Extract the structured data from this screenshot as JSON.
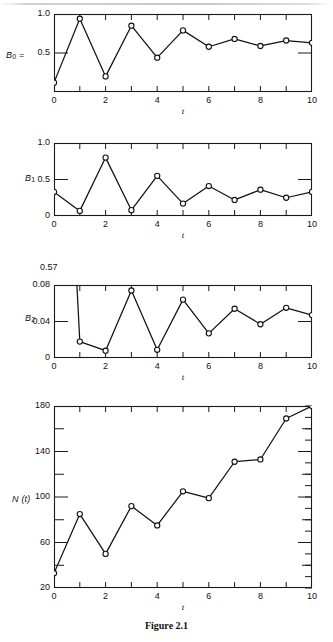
{
  "figure": {
    "caption": "Figure 2.1",
    "xlabel": "t",
    "x_tick_labels": [
      "0",
      "2",
      "4",
      "6",
      "8",
      "10"
    ],
    "x_tick_values": [
      0,
      2,
      4,
      6,
      8,
      10
    ],
    "x_minor_values": [
      1,
      3,
      5,
      7,
      9
    ],
    "xlim": [
      0,
      10
    ]
  },
  "chart_data": [
    {
      "type": "line",
      "id": "panel-b0",
      "title": "",
      "ylabel": "B₀ =",
      "ylabel_base": "B",
      "ylabel_sub": "0",
      "ylabel_suffix": " =",
      "xlabel": "t",
      "x": [
        0,
        1,
        2,
        3,
        4,
        5,
        6,
        7,
        8,
        9,
        10
      ],
      "values": [
        0.12,
        0.94,
        0.2,
        0.85,
        0.44,
        0.79,
        0.58,
        0.68,
        0.59,
        0.66,
        0.63
      ],
      "ylim": [
        0,
        1.0
      ],
      "y_tick_values": [
        0.5,
        1.0
      ],
      "y_tick_labels": [
        "0.5",
        "1.0"
      ],
      "grid": false,
      "legend": "none",
      "markers": "open-circle"
    },
    {
      "type": "line",
      "id": "panel-b1",
      "title": "",
      "ylabel": "B₁",
      "ylabel_base": "B",
      "ylabel_sub": "1",
      "ylabel_suffix": "",
      "xlabel": "t",
      "x": [
        0,
        1,
        2,
        3,
        4,
        5,
        6,
        7,
        8,
        9,
        10
      ],
      "values": [
        0.33,
        0.07,
        0.8,
        0.08,
        0.55,
        0.17,
        0.41,
        0.22,
        0.36,
        0.25,
        0.33
      ],
      "ylim": [
        0,
        1.0
      ],
      "y_tick_values": [
        0,
        0.5,
        1.0
      ],
      "y_tick_labels": [
        "0",
        "0.5",
        "1.0"
      ],
      "grid": false,
      "legend": "none",
      "markers": "open-circle"
    },
    {
      "type": "line",
      "id": "panel-b2",
      "title": "",
      "ylabel": "B₂",
      "ylabel_base": "B",
      "ylabel_sub": "2",
      "ylabel_suffix": "",
      "xlabel": "t",
      "annotation": "0.57",
      "annotation_note": "value at t=0 is off-scale above the axis",
      "x": [
        0,
        1,
        2,
        3,
        4,
        5,
        6,
        7,
        8,
        9,
        10
      ],
      "values": [
        0.57,
        0.018,
        0.008,
        0.074,
        0.009,
        0.064,
        0.027,
        0.054,
        0.037,
        0.055,
        0.047
      ],
      "ylim": [
        0,
        0.08
      ],
      "y_tick_values": [
        0,
        0.04,
        0.08
      ],
      "y_tick_labels": [
        "0",
        "0.04",
        "0.08"
      ],
      "grid": false,
      "legend": "none",
      "markers": "open-circle"
    },
    {
      "type": "line",
      "id": "panel-nt",
      "title": "",
      "ylabel": "N (t)",
      "ylabel_base": "N (t)",
      "ylabel_sub": "",
      "ylabel_suffix": "",
      "xlabel": "t",
      "x": [
        0,
        1,
        2,
        3,
        4,
        5,
        6,
        7,
        8,
        9,
        10
      ],
      "values": [
        33,
        85,
        50,
        92,
        75,
        105,
        99,
        131,
        133,
        169,
        180
      ],
      "ylim": [
        20,
        180
      ],
      "y_tick_values": [
        20,
        60,
        100,
        140,
        180
      ],
      "y_tick_labels": [
        "20",
        "60",
        "100",
        "140",
        "180"
      ],
      "y_minor_values": [
        40,
        80,
        120,
        160
      ],
      "grid": false,
      "legend": "none",
      "markers": "open-circle"
    }
  ]
}
